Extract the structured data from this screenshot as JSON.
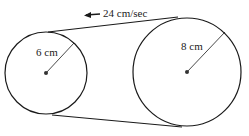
{
  "diagram": {
    "type": "belt-pulley",
    "speed_label": "24 cm/sec",
    "small_circle": {
      "radius_label": "6 cm",
      "cx": 46,
      "cy": 73,
      "r": 41
    },
    "large_circle": {
      "radius_label": "8 cm",
      "cx": 187,
      "cy": 72,
      "r": 54
    },
    "colors": {
      "stroke": "#1a1a1a",
      "background": "#ffffff"
    }
  }
}
